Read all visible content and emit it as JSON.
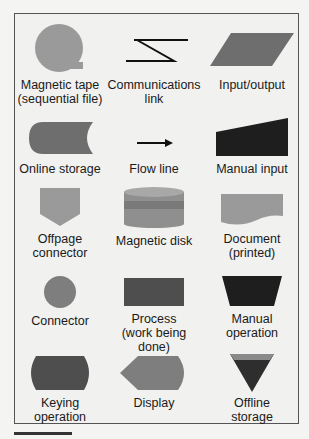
{
  "colors": {
    "light_gray": "#9a9a9a",
    "mid_gray": "#6e6e6e",
    "dark": "#1e1e1e",
    "disk_band": "#7d7d7d"
  },
  "symbols": [
    {
      "label1": "Magnetic tape",
      "label2": "(sequential file)"
    },
    {
      "label1": "Communications",
      "label2": "link"
    },
    {
      "label1": "Input/output",
      "label2": ""
    },
    {
      "label1": "Online storage",
      "label2": ""
    },
    {
      "label1": "Flow line",
      "label2": ""
    },
    {
      "label1": "Manual input",
      "label2": ""
    },
    {
      "label1": "Offpage",
      "label2": "connector"
    },
    {
      "label1": "Magnetic disk",
      "label2": ""
    },
    {
      "label1": "Document",
      "label2": "(printed)"
    },
    {
      "label1": "Connector",
      "label2": ""
    },
    {
      "label1": "Process",
      "label2": "(work being done)"
    },
    {
      "label1": "Manual",
      "label2": "operation"
    },
    {
      "label1": "Keying",
      "label2": "operation"
    },
    {
      "label1": "Display",
      "label2": ""
    },
    {
      "label1": "Offline",
      "label2": "storage"
    }
  ]
}
